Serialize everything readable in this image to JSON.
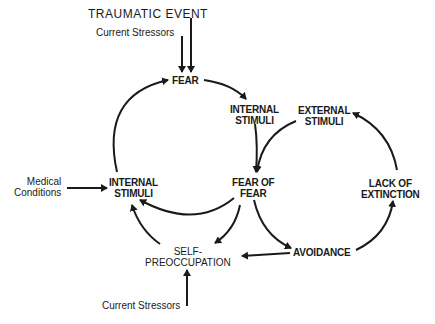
{
  "diagram": {
    "type": "cycle-flow",
    "nodes": {
      "traumatic_event": "TRAUMATIC EVENT",
      "current_stressors_top": "Current Stressors",
      "fear": "FEAR",
      "internal_stimuli_right": [
        "INTERNAL",
        "STIMULI"
      ],
      "external_stimuli": [
        "EXTERNAL",
        "STIMULI"
      ],
      "medical_conditions": [
        "Medical",
        "Conditions"
      ],
      "internal_stimuli_left": [
        "INTERNAL",
        "STIMULI"
      ],
      "fear_of_fear": [
        "FEAR OF",
        "FEAR"
      ],
      "lack_of_extinction": [
        "LACK OF",
        "EXTINCTION"
      ],
      "self_preoccupation": [
        "SELF-",
        "PREOCCUPATION"
      ],
      "avoidance": "AVOIDANCE",
      "current_stressors_bottom": "Current Stressors"
    },
    "edges": [
      {
        "from": "TRAUMATIC EVENT",
        "to": "FEAR"
      },
      {
        "from": "Current Stressors (top)",
        "to": "FEAR"
      },
      {
        "from": "FEAR",
        "to": "INTERNAL STIMULI (right)"
      },
      {
        "from": "INTERNAL STIMULI (right)",
        "to": "FEAR OF FEAR"
      },
      {
        "from": "EXTERNAL STIMULI",
        "to": "FEAR OF FEAR"
      },
      {
        "from": "FEAR OF FEAR",
        "to": "INTERNAL STIMULI (left)"
      },
      {
        "from": "FEAR OF FEAR",
        "to": "SELF-PREOCCUPATION"
      },
      {
        "from": "FEAR OF FEAR",
        "to": "AVOIDANCE"
      },
      {
        "from": "SELF-PREOCCUPATION",
        "to": "INTERNAL STIMULI (left)"
      },
      {
        "from": "INTERNAL STIMULI (left)",
        "to": "FEAR"
      },
      {
        "from": "Medical Conditions",
        "to": "INTERNAL STIMULI (left)"
      },
      {
        "from": "AVOIDANCE",
        "to": "SELF-PREOCCUPATION"
      },
      {
        "from": "AVOIDANCE",
        "to": "LACK OF EXTINCTION"
      },
      {
        "from": "LACK OF EXTINCTION",
        "to": "EXTERNAL STIMULI"
      },
      {
        "from": "Current Stressors (bottom)",
        "to": "SELF-PREOCCUPATION"
      }
    ],
    "colors": {
      "ink": "#1a1a1a",
      "background": "#ffffff"
    }
  }
}
